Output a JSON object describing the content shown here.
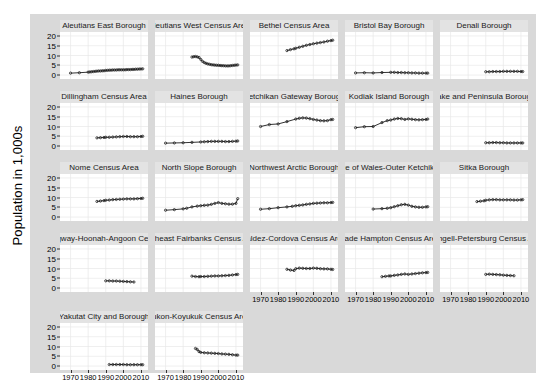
{
  "chart_data": {
    "type": "line",
    "title": "",
    "xlabel": "",
    "ylabel": "Population in 1,000s",
    "xlim": [
      1964,
      2014
    ],
    "ylim": [
      -2,
      22
    ],
    "xticks": [
      1970,
      1980,
      1990,
      2000,
      2010
    ],
    "xtick_labels": [
      "1970",
      "1980",
      "1990",
      "2000",
      "2010"
    ],
    "yticks": [
      0,
      5,
      10,
      15,
      20
    ],
    "ytick_labels": [
      "0",
      "5",
      "10",
      "15",
      "20"
    ],
    "grid": true,
    "legend": "none",
    "facet_columns": 5,
    "facet_rows": 5,
    "marker": "open-circle",
    "series_color": "#1a1a1a",
    "strip_color": "#e3e3e3",
    "panel_color": "#ffffff",
    "background_color": "#d9d9d9",
    "grid_color": "#e8e8e8",
    "panels": [
      {
        "name": "Aleutians East Borough",
        "x": [
          1970,
          1975,
          1980,
          1981,
          1982,
          1983,
          1984,
          1985,
          1986,
          1987,
          1988,
          1989,
          1990,
          1991,
          1992,
          1993,
          1994,
          1995,
          1996,
          1997,
          1998,
          1999,
          2000,
          2001,
          2002,
          2003,
          2004,
          2005,
          2006,
          2007,
          2008,
          2009,
          2010,
          2011
        ],
        "y": [
          1.0,
          1.2,
          1.5,
          1.6,
          1.7,
          1.8,
          1.9,
          2.0,
          2.1,
          2.1,
          2.2,
          2.2,
          2.4,
          2.4,
          2.5,
          2.5,
          2.6,
          2.6,
          2.6,
          2.7,
          2.7,
          2.7,
          2.7,
          2.7,
          2.8,
          2.8,
          2.8,
          2.9,
          2.9,
          3.0,
          3.0,
          3.1,
          3.1,
          3.2
        ]
      },
      {
        "name": "Aleutians West Census Area",
        "x": [
          1985,
          1986,
          1987,
          1988,
          1989,
          1990,
          1991,
          1992,
          1993,
          1994,
          1995,
          1996,
          1997,
          1998,
          1999,
          2000,
          2001,
          2002,
          2003,
          2004,
          2005,
          2006,
          2007,
          2008,
          2009,
          2010,
          2011
        ],
        "y": [
          9.2,
          9.4,
          9.5,
          9.3,
          9.0,
          8.0,
          7.0,
          6.4,
          6.0,
          5.7,
          5.5,
          5.3,
          5.2,
          5.1,
          5.0,
          5.0,
          4.9,
          4.8,
          4.8,
          4.7,
          4.7,
          4.7,
          4.8,
          4.9,
          5.0,
          5.1,
          5.2
        ]
      },
      {
        "name": "Bethel Census Area",
        "x": [
          1985,
          1987,
          1989,
          1990,
          1992,
          1994,
          1996,
          1998,
          2000,
          2002,
          2004,
          2006,
          2008,
          2010,
          2011
        ],
        "y": [
          12.5,
          13.0,
          13.4,
          13.7,
          14.2,
          14.7,
          15.2,
          15.6,
          16.0,
          16.3,
          16.6,
          16.9,
          17.3,
          17.6,
          17.8
        ]
      },
      {
        "name": "Bristol Bay Borough",
        "x": [
          1970,
          1975,
          1980,
          1985,
          1990,
          1992,
          1994,
          1996,
          1998,
          2000,
          2002,
          2004,
          2006,
          2008,
          2010,
          2011
        ],
        "y": [
          1.1,
          1.2,
          1.1,
          1.3,
          1.4,
          1.4,
          1.3,
          1.3,
          1.2,
          1.2,
          1.1,
          1.1,
          1.0,
          1.0,
          1.0,
          1.0
        ]
      },
      {
        "name": "Denali Borough",
        "x": [
          1990,
          1992,
          1994,
          1996,
          1998,
          2000,
          2002,
          2004,
          2006,
          2008,
          2010,
          2011
        ],
        "y": [
          1.7,
          1.7,
          1.8,
          1.8,
          1.8,
          1.9,
          1.9,
          1.9,
          1.9,
          1.9,
          1.8,
          1.8
        ]
      },
      {
        "name": "Dillingham Census Area",
        "x": [
          1985,
          1987,
          1989,
          1990,
          1992,
          1994,
          1996,
          1998,
          2000,
          2002,
          2004,
          2006,
          2008,
          2010,
          2011
        ],
        "y": [
          4.2,
          4.3,
          4.4,
          4.5,
          4.5,
          4.6,
          4.7,
          4.8,
          4.9,
          4.9,
          4.8,
          4.8,
          4.8,
          4.9,
          5.0
        ]
      },
      {
        "name": "Haines Borough",
        "x": [
          1970,
          1975,
          1980,
          1985,
          1990,
          1992,
          1994,
          1996,
          1998,
          2000,
          2002,
          2004,
          2006,
          2008,
          2010,
          2011
        ],
        "y": [
          1.5,
          1.6,
          1.7,
          1.9,
          2.1,
          2.2,
          2.3,
          2.4,
          2.4,
          2.4,
          2.4,
          2.3,
          2.3,
          2.4,
          2.5,
          2.6
        ]
      },
      {
        "name": "Ketchikan Gateway Borough",
        "x": [
          1970,
          1975,
          1980,
          1985,
          1990,
          1992,
          1994,
          1996,
          1998,
          2000,
          2002,
          2004,
          2006,
          2008,
          2010,
          2011
        ],
        "y": [
          10.0,
          11.0,
          11.3,
          12.5,
          13.8,
          14.2,
          14.4,
          14.3,
          14.0,
          13.6,
          13.3,
          13.0,
          12.9,
          13.0,
          13.5,
          13.6
        ]
      },
      {
        "name": "Kodiak Island Borough",
        "x": [
          1970,
          1975,
          1980,
          1985,
          1988,
          1990,
          1992,
          1994,
          1996,
          1998,
          2000,
          2002,
          2004,
          2006,
          2008,
          2010,
          2011
        ],
        "y": [
          9.4,
          9.9,
          10.0,
          12.0,
          13.0,
          13.3,
          13.8,
          14.1,
          14.0,
          13.6,
          13.9,
          13.7,
          13.5,
          13.4,
          13.5,
          13.6,
          13.8
        ]
      },
      {
        "name": "Lake and Peninsula Borough",
        "x": [
          1990,
          1992,
          1994,
          1996,
          1998,
          2000,
          2002,
          2004,
          2006,
          2008,
          2010,
          2011
        ],
        "y": [
          1.7,
          1.7,
          1.8,
          1.8,
          1.7,
          1.7,
          1.6,
          1.6,
          1.6,
          1.6,
          1.6,
          1.6
        ]
      },
      {
        "name": "Nome Census Area",
        "x": [
          1985,
          1987,
          1989,
          1990,
          1992,
          1994,
          1996,
          1998,
          2000,
          2002,
          2004,
          2006,
          2008,
          2010,
          2011
        ],
        "y": [
          8.0,
          8.2,
          8.4,
          8.6,
          8.7,
          8.9,
          9.0,
          9.1,
          9.2,
          9.3,
          9.3,
          9.3,
          9.4,
          9.5,
          9.6
        ]
      },
      {
        "name": "North Slope Borough",
        "x": [
          1970,
          1975,
          1980,
          1982,
          1985,
          1988,
          1990,
          1992,
          1994,
          1996,
          1998,
          2000,
          2002,
          2004,
          2006,
          2008,
          2010,
          2011
        ],
        "y": [
          3.5,
          3.8,
          4.2,
          4.5,
          5.2,
          5.6,
          5.8,
          6.0,
          6.1,
          6.5,
          7.0,
          7.4,
          7.0,
          6.8,
          6.6,
          6.6,
          7.0,
          9.4
        ]
      },
      {
        "name": "Northwest Arctic Borough",
        "x": [
          1970,
          1975,
          1980,
          1985,
          1988,
          1990,
          1992,
          1994,
          1996,
          1998,
          2000,
          2002,
          2004,
          2006,
          2008,
          2010,
          2011
        ],
        "y": [
          4.0,
          4.3,
          4.8,
          5.2,
          5.5,
          5.8,
          6.0,
          6.2,
          6.5,
          6.7,
          7.0,
          7.1,
          7.2,
          7.3,
          7.3,
          7.4,
          7.5
        ]
      },
      {
        "name": "Prince of Wales-Outer Ketchikan C",
        "x": [
          1980,
          1985,
          1988,
          1990,
          1992,
          1994,
          1996,
          1998,
          2000,
          2002,
          2004,
          2006,
          2008,
          2010,
          2011
        ],
        "y": [
          4.1,
          4.3,
          4.5,
          4.8,
          5.3,
          5.8,
          6.3,
          6.5,
          6.1,
          5.5,
          5.2,
          5.0,
          5.0,
          5.2,
          5.3
        ]
      },
      {
        "name": "Sitka Borough",
        "x": [
          1985,
          1987,
          1989,
          1990,
          1992,
          1994,
          1996,
          1998,
          2000,
          2002,
          2004,
          2006,
          2008,
          2010,
          2011
        ],
        "y": [
          7.9,
          8.1,
          8.3,
          8.6,
          8.8,
          8.9,
          8.9,
          8.8,
          8.8,
          8.8,
          8.8,
          8.7,
          8.7,
          8.8,
          8.9
        ]
      },
      {
        "name": "Skagway-Hoonah-Angoon Census",
        "x": [
          1990,
          1992,
          1994,
          1996,
          1998,
          2000,
          2002,
          2004,
          2006
        ],
        "y": [
          3.7,
          3.7,
          3.6,
          3.6,
          3.5,
          3.4,
          3.3,
          3.2,
          3.1
        ]
      },
      {
        "name": "Southeast Fairbanks Census Area",
        "x": [
          1985,
          1987,
          1989,
          1990,
          1992,
          1994,
          1996,
          1998,
          2000,
          2002,
          2004,
          2006,
          2008,
          2010,
          2011
        ],
        "y": [
          6.1,
          5.9,
          5.8,
          5.9,
          5.9,
          6.0,
          6.1,
          6.2,
          6.2,
          6.3,
          6.4,
          6.5,
          6.7,
          6.9,
          7.0
        ]
      },
      {
        "name": "Valdez-Cordova Census Area",
        "x": [
          1985,
          1987,
          1989,
          1990,
          1992,
          1994,
          1996,
          1998,
          2000,
          2002,
          2004,
          2006,
          2008,
          2010,
          2011
        ],
        "y": [
          9.6,
          9.2,
          9.0,
          9.9,
          10.2,
          10.1,
          10.0,
          10.0,
          10.2,
          10.1,
          9.9,
          9.8,
          9.8,
          9.6,
          9.5
        ]
      },
      {
        "name": "Wade Hampton Census Area",
        "x": [
          1985,
          1987,
          1989,
          1990,
          1992,
          1994,
          1996,
          1998,
          2000,
          2002,
          2004,
          2006,
          2008,
          2010,
          2011
        ],
        "y": [
          5.8,
          6.0,
          6.2,
          6.2,
          6.5,
          6.7,
          7.0,
          7.2,
          7.0,
          7.2,
          7.4,
          7.6,
          7.8,
          7.9,
          8.0
        ]
      },
      {
        "name": "Wrangell-Petersburg Census Area",
        "x": [
          1990,
          1992,
          1994,
          1996,
          1998,
          2000,
          2002,
          2004,
          2006
        ],
        "y": [
          7.0,
          7.1,
          7.0,
          6.9,
          6.8,
          6.6,
          6.5,
          6.4,
          6.3
        ]
      },
      {
        "name": "Yakutat City and Borough",
        "x": [
          1992,
          1994,
          1996,
          1998,
          2000,
          2002,
          2004,
          2006,
          2008,
          2010,
          2011
        ],
        "y": [
          0.8,
          0.8,
          0.8,
          0.8,
          0.8,
          0.7,
          0.7,
          0.7,
          0.7,
          0.7,
          0.7
        ]
      },
      {
        "name": "Yukon-Koyukuk Census Area",
        "x": [
          1987,
          1988,
          1989,
          1990,
          1992,
          1994,
          1996,
          1998,
          2000,
          2002,
          2004,
          2006,
          2008,
          2010,
          2011
        ],
        "y": [
          9.0,
          8.5,
          7.4,
          7.0,
          6.8,
          6.7,
          6.6,
          6.5,
          6.4,
          6.2,
          6.1,
          6.0,
          5.8,
          5.6,
          5.6
        ]
      }
    ]
  }
}
